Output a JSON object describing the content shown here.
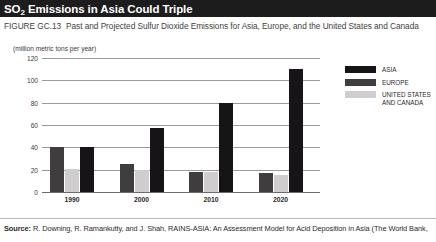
{
  "title": {
    "prefix": "SO",
    "subscript": "2",
    "rest": " Emissions in Asia Could Triple"
  },
  "figure": {
    "number": "FIGURE GC.13",
    "caption": "Past and Projected Sulfur Dioxide Emissions for Asia, Europe, and the United States and Canada"
  },
  "source": {
    "label": "Source:",
    "text": "R. Downing, R. Ramankutty, and J. Shah, RAINS-ASIA: An Assessment Model for Acid Deposition in Asia (The World Bank,"
  },
  "legend": {
    "items": [
      {
        "key": "asia",
        "label": "ASIA",
        "color": "#161416"
      },
      {
        "key": "europe",
        "label": "EUROPE",
        "color": "#3f3d3e"
      },
      {
        "key": "usca",
        "label": "UNITED STATES\nAND CANADA",
        "color": "#cfcdcd"
      }
    ]
  },
  "chart_data": {
    "type": "bar",
    "title": "SO2 Emissions in Asia Could Triple",
    "subtitle": "Past and Projected Sulfur Dioxide Emissions for Asia, Europe, and the United States and Canada",
    "xlabel": "",
    "ylabel": "(million metric tons per year)",
    "units_note": "(million metric tons per year)",
    "categories": [
      "1990",
      "2000",
      "2010",
      "2020"
    ],
    "series": [
      {
        "name": "EUROPE",
        "color": "#3f3d3e",
        "values": [
          40,
          25,
          18,
          17
        ]
      },
      {
        "name": "UNITED STATES AND CANADA",
        "color": "#cfcdcd",
        "values": [
          21,
          20,
          18,
          15
        ]
      },
      {
        "name": "ASIA",
        "color": "#161416",
        "values": [
          40,
          57,
          80,
          110
        ]
      }
    ],
    "series_draw_order": [
      "EUROPE",
      "UNITED STATES AND CANADA",
      "ASIA"
    ],
    "ylim": [
      0,
      120
    ],
    "yticks": [
      0,
      20,
      40,
      60,
      80,
      100,
      120
    ],
    "ytick_labels": [
      "0",
      "20",
      "40",
      "60",
      "80",
      "100",
      "120"
    ],
    "grid": true,
    "legend_position": "right"
  }
}
